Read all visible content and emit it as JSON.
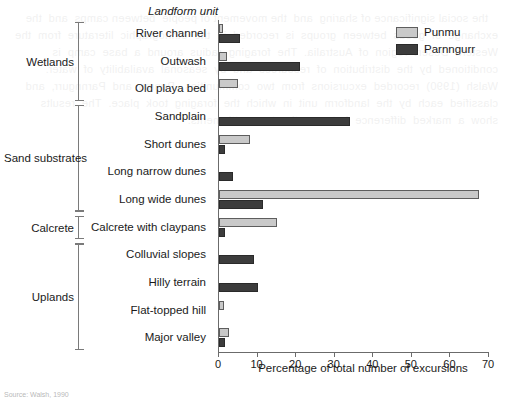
{
  "axis_title": "Landform unit",
  "xlabel": "Percentage of total number of excursions",
  "caption": "Source: Walsh, 1990",
  "legend": {
    "position": "top-right",
    "items": [
      {
        "label": "Punmu",
        "color": "#c9c9c9"
      },
      {
        "label": "Parnngurr",
        "color": "#3c3c3c"
      }
    ]
  },
  "groups": [
    {
      "label": "Wetlands",
      "start": 0,
      "count": 3
    },
    {
      "label": "Sand substrates",
      "start": 3,
      "count": 4
    },
    {
      "label": "Calcrete",
      "start": 7,
      "count": 1
    },
    {
      "label": "Uplands",
      "start": 8,
      "count": 4
    }
  ],
  "chart_data": {
    "type": "bar",
    "orientation": "horizontal",
    "title": "",
    "xlabel": "Percentage of total number of excursions",
    "ylabel": "Landform unit",
    "xlim": [
      0,
      70
    ],
    "xticks": [
      0,
      10,
      20,
      30,
      40,
      50,
      60,
      70
    ],
    "grid": false,
    "legend_position": "top-right",
    "categories": [
      "River channel",
      "Outwash",
      "Old playa bed",
      "Sandplain",
      "Short dunes",
      "Long narrow dunes",
      "Long wide dunes",
      "Calcrete with claypans",
      "Colluvial slopes",
      "Hilly terrain",
      "Flat-topped hill",
      "Major valley"
    ],
    "series": [
      {
        "name": "Punmu",
        "color": "#c9c9c9",
        "values": [
          1.0,
          2.0,
          5.0,
          0.0,
          8.0,
          0.0,
          67.5,
          15.0,
          0.0,
          0.0,
          1.2,
          2.5
        ]
      },
      {
        "name": "Parnngurr",
        "color": "#3c3c3c",
        "values": [
          5.5,
          21.0,
          0.0,
          34.0,
          1.5,
          3.5,
          11.5,
          1.5,
          9.0,
          10.0,
          0.0,
          1.5
        ]
      }
    ]
  }
}
